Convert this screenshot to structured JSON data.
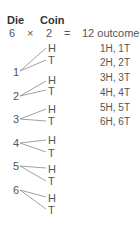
{
  "header": {
    "die_label": "Die",
    "coin_label": "Coin",
    "die_count": "6",
    "times": "×",
    "coin_count": "2",
    "equals": "=",
    "result": "12 outcomes"
  },
  "tree": [
    {
      "die": "1",
      "branches": [
        "H",
        "T"
      ]
    },
    {
      "die": "2",
      "branches": [
        "H",
        "T"
      ]
    },
    {
      "die": "3",
      "branches": [
        "H",
        "T"
      ]
    },
    {
      "die": "4",
      "branches": [
        "H",
        "T"
      ]
    },
    {
      "die": "5",
      "branches": [
        "H",
        "T"
      ]
    },
    {
      "die": "6",
      "branches": [
        "H",
        "T"
      ]
    }
  ],
  "outcomes": [
    "1H, 1T",
    "2H, 2T",
    "3H, 3T",
    "4H, 4T",
    "5H, 5T",
    "6H, 6T"
  ],
  "colors": {
    "text": "#555555",
    "header": "#333333",
    "line": "#888888"
  }
}
